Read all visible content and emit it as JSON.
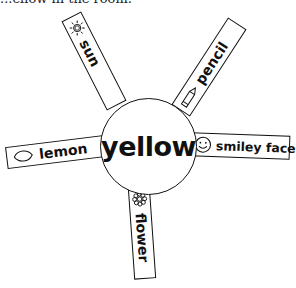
{
  "caption": "...ellow in the room.",
  "center": {
    "word": "yellow"
  },
  "spokes": [
    {
      "label": "sun",
      "icon": "sun-icon"
    },
    {
      "label": "pencil",
      "icon": "pencil-icon"
    },
    {
      "label": "lemon",
      "icon": "lemon-icon"
    },
    {
      "label": "smiley face",
      "icon": "smiley-face-icon"
    },
    {
      "label": "flower",
      "icon": "flower-icon"
    }
  ],
  "colors": {
    "line": "#111111",
    "background": "#ffffff"
  }
}
